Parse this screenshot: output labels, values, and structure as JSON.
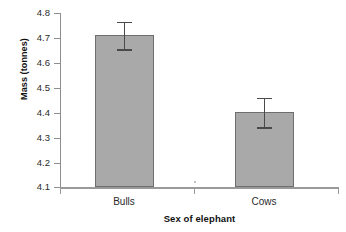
{
  "chart_data": {
    "type": "bar",
    "title": "",
    "subtitle": "",
    "xlabel": "Sex of elephant",
    "ylabel": "Mass (tonnes)",
    "categories": [
      "Bulls",
      "Cows"
    ],
    "values": [
      4.71,
      4.4
    ],
    "errors": [
      0.055,
      0.06
    ],
    "error_bars": [
      {
        "category": "Bulls",
        "lower": 4.655,
        "upper": 4.765
      },
      {
        "category": "Cows",
        "lower": 4.34,
        "upper": 4.46
      }
    ],
    "ylim": [
      4.1,
      4.8
    ],
    "ytick_values": [
      4.8,
      4.7,
      4.6,
      4.5,
      4.4,
      4.3,
      4.2,
      4.1
    ],
    "ytick_labels": [
      "4.8",
      "4.7",
      "4.6",
      "4.5",
      "4.4",
      "4.3",
      "4.2",
      "4.1"
    ],
    "grid": false,
    "legend": false,
    "legend_position": "none",
    "bar_fill_color": "#a9a9a9",
    "bar_edge_color": "#6e6e6e",
    "error_bar_color": "#4a4a4a",
    "axis_color": "#9a9a9a",
    "background_color": "#ffffff"
  },
  "axes": {
    "y_title": "Mass (tonnes)",
    "x_title": "Sex of elephant"
  },
  "y_ticks": [
    {
      "label": "4.8"
    },
    {
      "label": "4.7"
    },
    {
      "label": "4.6"
    },
    {
      "label": "4.5"
    },
    {
      "label": "4.4"
    },
    {
      "label": "4.3"
    },
    {
      "label": "4.2"
    },
    {
      "label": "4.1"
    }
  ],
  "x_ticks": [
    {
      "label": "Bulls"
    },
    {
      "label": "Cows"
    }
  ]
}
